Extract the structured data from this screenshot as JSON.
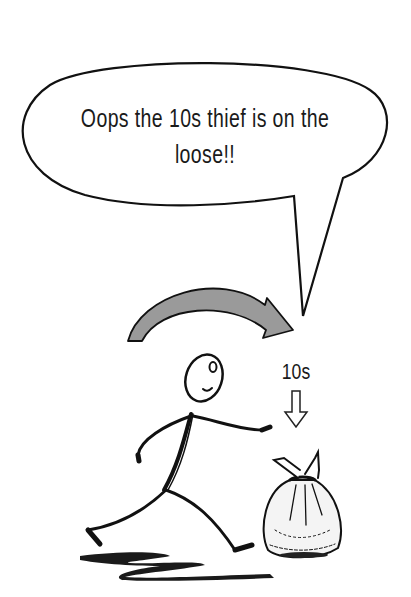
{
  "speech_bubble": {
    "line1": "Oops the 10s thief is on the",
    "line2": "loose!!"
  },
  "label": {
    "value": "10s"
  },
  "icons": {
    "bubble": "speech-bubble-icon",
    "curved_arrow": "curved-arrow-icon",
    "down_arrow": "down-arrow-icon",
    "figure": "stick-figure-icon",
    "bag": "money-bag-icon",
    "shadow": "shadow-icon"
  },
  "colors": {
    "line": "#111111",
    "arrow_fill": "#9a9a9a",
    "background": "#ffffff"
  }
}
